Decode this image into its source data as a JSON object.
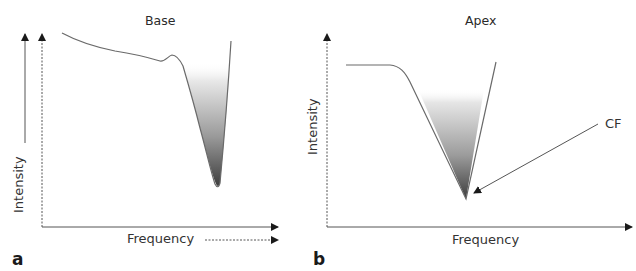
{
  "figure": {
    "panels": [
      {
        "tag": "a",
        "title": "Base",
        "ylabel": "Intensity",
        "xlabel": "Frequency"
      },
      {
        "tag": "b",
        "title": "Apex",
        "ylabel": "Intensity",
        "xlabel": "Frequency",
        "annotation": "CF"
      }
    ]
  },
  "icons": {
    "arrows": [
      "arrow-up-icon",
      "arrow-right-icon"
    ]
  },
  "colors": {
    "line": "#6a6a6a",
    "fill_dark": "#4a4a4a",
    "fill_light": "#f4f4f4",
    "text": "#2a2a2a"
  }
}
